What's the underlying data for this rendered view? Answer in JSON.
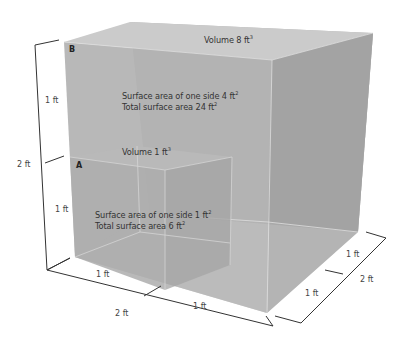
{
  "diagram": {
    "type": "nested-cubes-volume-surface-area",
    "colors": {
      "background": "#ffffff",
      "cube_front": "#b3b3b3",
      "cube_side": "#a6a6a6",
      "cube_top": "#c4c4c4",
      "edge_light": "#d9d9d9",
      "dimension_line": "#333333",
      "text": "#333333"
    },
    "cube_b": {
      "corner_label": "B",
      "volume_label": "Volume 8 ft",
      "volume_exp": "3",
      "side_area_label": "Surface area of one side 4 ft",
      "side_area_exp": "2",
      "total_area_label": "Total surface area 24 ft",
      "total_area_exp": "2"
    },
    "cube_a": {
      "corner_label": "A",
      "volume_label": "Volume 1 ft",
      "volume_exp": "3",
      "side_area_label": "Surface area of one side 1 ft",
      "side_area_exp": "2",
      "total_area_label": "Total surface area 6 ft",
      "total_area_exp": "2"
    },
    "dimensions": {
      "left_upper": "1 ft",
      "left_lower": "1 ft",
      "left_total": "2 ft",
      "bottom_left": "1 ft",
      "bottom_right": "1 ft",
      "bottom_total": "2 ft",
      "right_upper": "1 ft",
      "right_lower": "1 ft",
      "right_total": "2 ft"
    }
  }
}
